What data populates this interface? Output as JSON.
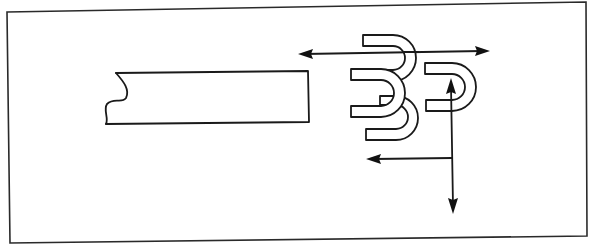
{
  "diagram": {
    "colors": {
      "line": "#1a1a1a",
      "background": "#ffffff"
    },
    "elements": [
      {
        "id": "frame",
        "type": "border-frame"
      },
      {
        "id": "bar",
        "type": "rod-with-broken-end"
      },
      {
        "id": "u-top",
        "type": "u-shape",
        "orientation": "opening-left"
      },
      {
        "id": "u-middle",
        "type": "u-shape",
        "orientation": "opening-left"
      },
      {
        "id": "u-bottom",
        "type": "u-shape",
        "orientation": "opening-left"
      },
      {
        "id": "u-right",
        "type": "u-shape",
        "orientation": "opening-left"
      },
      {
        "id": "arrow-horizontal-double",
        "type": "double-headed-arrow",
        "direction": "left-right"
      },
      {
        "id": "arrow-vertical-double",
        "type": "double-headed-arrow",
        "direction": "up-down"
      },
      {
        "id": "arrow-left",
        "type": "arrow",
        "direction": "left"
      }
    ],
    "labels": []
  }
}
